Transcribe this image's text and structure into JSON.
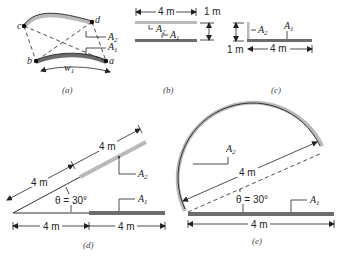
{
  "figure": {
    "panels": [
      {
        "id": "a",
        "caption": "(a)",
        "points": [
          "a",
          "b",
          "c",
          "d"
        ],
        "surfaces": [
          "A2",
          "A1"
        ],
        "width_label": "w1"
      },
      {
        "id": "b",
        "caption": "(b)",
        "width": "4 m",
        "spacing": "1 m",
        "surfaces": [
          "A2",
          "A1"
        ]
      },
      {
        "id": "c",
        "caption": "(c)",
        "height": "1 m",
        "width": "4 m",
        "surfaces": [
          "A2",
          "A1"
        ]
      },
      {
        "id": "d",
        "caption": "(d)",
        "inclined_gap": "4 m",
        "inclined_length": "4 m",
        "angle": "θ = 30°",
        "horizontal_gap": "4 m",
        "horizontal_length": "4 m",
        "surfaces": [
          "A2",
          "A1"
        ]
      },
      {
        "id": "e",
        "caption": "(e)",
        "chord": "4 m",
        "angle": "θ = 30°",
        "base": "4 m",
        "surfaces": [
          "A2",
          "A1"
        ]
      }
    ]
  },
  "labels": {
    "a": "a",
    "b": "b",
    "c": "c",
    "d": "d",
    "A": "A",
    "sub1": "1",
    "sub2": "2",
    "w": "w",
    "four_m": "4 m",
    "one_m": "1 m",
    "theta": "θ = 30°"
  },
  "colors": {
    "surface_light": "#b9b9b9",
    "surface_dark": "#6c6c6c",
    "line": "#222222"
  }
}
